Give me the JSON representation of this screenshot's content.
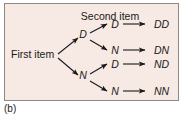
{
  "figure": {
    "caption": "(b)",
    "panel_background": "#f7e9e3",
    "border_color": "#8d8a86",
    "ink_color": "#1a1a1a"
  },
  "diagram": {
    "type": "probability-tree",
    "stage_labels": {
      "first": "First item",
      "second": "Second item"
    },
    "root_label": "First item",
    "level1_nodes": [
      {
        "id": "D",
        "label": "D"
      },
      {
        "id": "N",
        "label": "N"
      }
    ],
    "level2_nodes": [
      {
        "id": "D-D",
        "parent": "D",
        "label": "D"
      },
      {
        "id": "D-N",
        "parent": "D",
        "label": "N"
      },
      {
        "id": "N-D",
        "parent": "N",
        "label": "D"
      },
      {
        "id": "N-N",
        "parent": "N",
        "label": "N"
      }
    ],
    "outcomes": [
      {
        "id": "DD",
        "label": "DD"
      },
      {
        "id": "DN",
        "label": "DN"
      },
      {
        "id": "ND",
        "label": "ND"
      },
      {
        "id": "NN",
        "label": "NN"
      }
    ]
  }
}
